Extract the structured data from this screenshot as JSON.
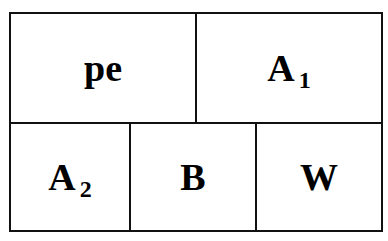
{
  "diagram": {
    "top_row": [
      {
        "label": "pe",
        "subscript": null
      },
      {
        "label": "A",
        "subscript": "1"
      }
    ],
    "bottom_row": [
      {
        "label": "A",
        "subscript": "2"
      },
      {
        "label": "B",
        "subscript": null
      },
      {
        "label": "W",
        "subscript": null
      }
    ]
  }
}
